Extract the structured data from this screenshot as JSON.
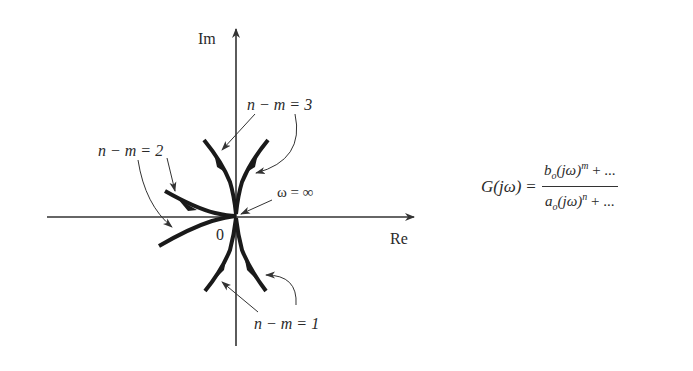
{
  "diagram": {
    "type": "polar-plot-sketch",
    "axes": {
      "real_label": "Re",
      "imag_label": "Im",
      "origin_label": "0"
    },
    "annotations": {
      "omega_infinity": "ω = ∞",
      "n_minus_m_1": "n − m = 1",
      "n_minus_m_2": "n − m = 2",
      "n_minus_m_3": "n − m = 3"
    },
    "formula": {
      "lhs": "G(jω)",
      "equals": "=",
      "numerator": {
        "coef": "b",
        "coef_sub": "o",
        "base": "(jω)",
        "exp": "m",
        "tail": " + ..."
      },
      "denominator": {
        "coef": "a",
        "coef_sub": "o",
        "base": "(jω)",
        "exp": "n",
        "tail": " + ..."
      }
    },
    "colors": {
      "curve": "#1a1a1a",
      "axis": "#333333",
      "text": "#2a2a2a"
    }
  }
}
